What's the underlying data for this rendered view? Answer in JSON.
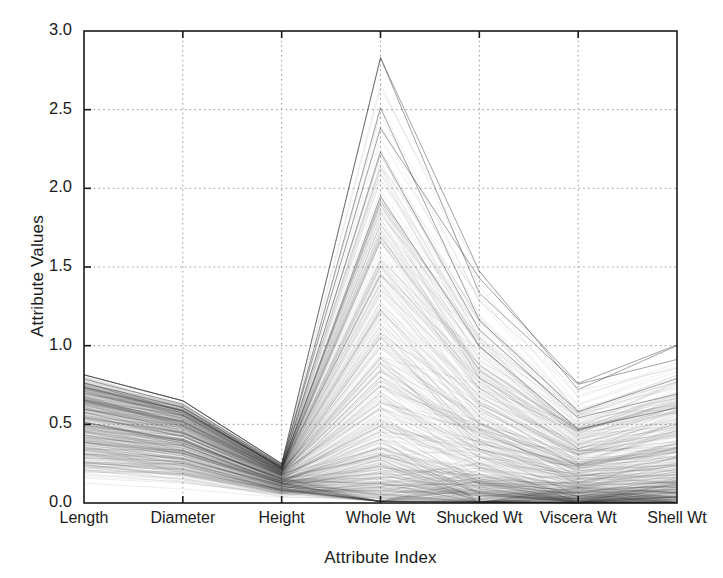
{
  "chart_data": {
    "type": "line",
    "subtype": "parallel-coordinates",
    "title": "",
    "xlabel": "Attribute Index",
    "ylabel": "Attribute Values",
    "categories": [
      "Length",
      "Diameter",
      "Height",
      "Whole Wt",
      "Shucked Wt",
      "Viscera Wt",
      "Shell Wt"
    ],
    "ylim": [
      0.0,
      3.0
    ],
    "yticks": [
      "0.0",
      "0.5",
      "1.0",
      "1.5",
      "2.0",
      "2.5",
      "3.0"
    ],
    "ytick_values": [
      0.0,
      0.5,
      1.0,
      1.5,
      2.0,
      2.5,
      3.0
    ],
    "grid": true,
    "grid_style": "dotted",
    "legend": "none",
    "line_color": "#2b2b2b",
    "line_opacity": 0.12,
    "background": "#ffffff",
    "axis_color": "#1a1a1a",
    "n_lines": 420,
    "axis_ranges": [
      {
        "name": "Length",
        "min": 0.055,
        "max": 0.815,
        "median": 0.545,
        "q1": 0.45,
        "q3": 0.665
      },
      {
        "name": "Diameter",
        "min": 0.04,
        "max": 0.65,
        "median": 0.425,
        "q1": 0.35,
        "q3": 0.52
      },
      {
        "name": "Height",
        "min": 0.01,
        "max": 0.25,
        "median": 0.14,
        "q1": 0.115,
        "q3": 0.165
      },
      {
        "name": "Whole Wt",
        "min": 0.01,
        "max": 2.83,
        "median": 0.8,
        "q1": 0.442,
        "q3": 1.153
      },
      {
        "name": "Shucked Wt",
        "min": 0.005,
        "max": 1.49,
        "median": 0.336,
        "q1": 0.186,
        "q3": 0.502
      },
      {
        "name": "Viscera Wt",
        "min": 0.002,
        "max": 0.76,
        "median": 0.171,
        "q1": 0.094,
        "q3": 0.253
      },
      {
        "name": "Shell Wt",
        "min": 0.003,
        "max": 1.005,
        "median": 0.234,
        "q1": 0.13,
        "q3": 0.329
      }
    ],
    "notable_peaks": [
      {
        "axis": "Whole Wt",
        "value": 2.83
      },
      {
        "axis": "Whole Wt",
        "value": 2.51
      },
      {
        "axis": "Whole Wt",
        "value": 2.23
      },
      {
        "axis": "Whole Wt",
        "value": 1.95
      },
      {
        "axis": "Shell Wt",
        "value": 1.0
      },
      {
        "axis": "Viscera Wt",
        "value": 0.76
      }
    ],
    "plot_box": {
      "left": 84,
      "top": 31,
      "right": 677,
      "bottom": 503
    }
  }
}
